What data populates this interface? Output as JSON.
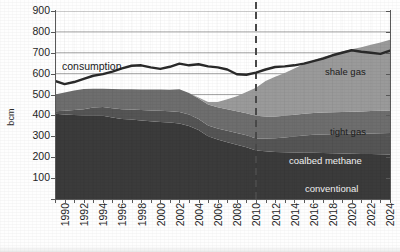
{
  "chart_data": {
    "type": "area",
    "title": "",
    "xlabel": "",
    "ylabel": "bcm",
    "ylim": [
      0,
      900
    ],
    "xlim": [
      1990,
      2025
    ],
    "grid": true,
    "legend_position": "inline-labels",
    "y_ticks": [
      100,
      200,
      300,
      400,
      500,
      600,
      700,
      800,
      900
    ],
    "x_ticks": [
      1990,
      1992,
      1994,
      1996,
      1998,
      2000,
      2002,
      2004,
      2006,
      2008,
      2010,
      2012,
      2014,
      2016,
      2018,
      2020,
      2022,
      2024
    ],
    "x": [
      1990,
      1991,
      1992,
      1993,
      1994,
      1995,
      1996,
      1997,
      1998,
      1999,
      2000,
      2001,
      2002,
      2003,
      2004,
      2005,
      2006,
      2007,
      2008,
      2009,
      2010,
      2011,
      2012,
      2013,
      2014,
      2015,
      2016,
      2017,
      2018,
      2019,
      2020,
      2021,
      2022,
      2023,
      2024,
      2025
    ],
    "stacked": true,
    "series": [
      {
        "name": "conventional",
        "color": "#3b3b3b",
        "values": [
          408,
          405,
          402,
          400,
          400,
          398,
          390,
          383,
          380,
          376,
          372,
          369,
          366,
          362,
          350,
          330,
          300,
          285,
          272,
          260,
          248,
          232,
          228,
          225,
          224,
          223,
          222,
          221,
          220,
          219,
          218,
          217,
          216,
          215,
          214,
          213
        ]
      },
      {
        "name": "coalbed methane",
        "color": "#555555",
        "values": [
          12,
          17,
          24,
          30,
          38,
          42,
          45,
          47,
          48,
          50,
          52,
          53,
          54,
          55,
          54,
          53,
          52,
          53,
          55,
          56,
          57,
          58,
          62,
          66,
          70,
          76,
          82,
          86,
          89,
          91,
          93,
          95,
          97,
          99,
          101,
          103
        ]
      },
      {
        "name": "tight gas",
        "color": "#6e6e6e",
        "values": [
          80,
          88,
          93,
          96,
          90,
          88,
          92,
          95,
          97,
          98,
          100,
          102,
          103,
          108,
          104,
          98,
          100,
          101,
          103,
          104,
          105,
          108,
          105,
          104,
          104,
          104,
          104,
          105,
          105,
          105,
          106,
          106,
          106,
          107,
          107,
          108
        ]
      },
      {
        "name": "shale gas",
        "color": "#9a9a9a",
        "values": [
          0,
          0,
          0,
          0,
          0,
          0,
          0,
          0,
          0,
          0,
          0,
          0,
          0,
          0,
          0,
          5,
          12,
          25,
          48,
          72,
          102,
          135,
          170,
          190,
          205,
          222,
          238,
          252,
          266,
          278,
          289,
          299,
          308,
          317,
          327,
          338
        ]
      }
    ],
    "line_series": {
      "name": "consumption",
      "color": "#2a2a2a",
      "values": [
        565,
        550,
        560,
        575,
        590,
        598,
        610,
        625,
        638,
        640,
        630,
        623,
        633,
        648,
        640,
        645,
        635,
        630,
        620,
        597,
        595,
        605,
        620,
        632,
        635,
        640,
        648,
        660,
        672,
        688,
        700,
        712,
        705,
        700,
        695,
        710
      ]
    },
    "annotations": [
      {
        "name": "forecast-divider",
        "type": "vertical-dashed-line",
        "x": 2011,
        "color": "#4a4a4a"
      }
    ],
    "inline_labels": [
      {
        "name": "consumption",
        "text": "consumption"
      },
      {
        "name": "shale-gas",
        "text": "shale gas"
      },
      {
        "name": "tight-gas",
        "text": "tight gas"
      },
      {
        "name": "coalbed-methane",
        "text": "coalbed methane"
      },
      {
        "name": "conventional",
        "text": "conventional"
      }
    ]
  },
  "axes": {
    "y_title": "bcm",
    "y_labels": [
      "900",
      "800",
      "700",
      "600",
      "500",
      "400",
      "300",
      "200",
      "100"
    ],
    "x_labels": [
      "1990",
      "1992",
      "1994",
      "1996",
      "1998",
      "2000",
      "2002",
      "2004",
      "2006",
      "2008",
      "2010",
      "2012",
      "2014",
      "2016",
      "2018",
      "2020",
      "2022",
      "2024"
    ]
  },
  "labels": {
    "consumption": "consumption",
    "shale_gas": "shale gas",
    "tight_gas": "tight gas",
    "coalbed_methane": "coalbed methane",
    "conventional": "conventional"
  },
  "colors": {
    "conventional": "#3b3b3b",
    "coalbed_methane": "#555555",
    "tight_gas": "#6e6e6e",
    "shale_gas": "#9a9a9a",
    "consumption_line": "#2a2a2a",
    "gridline": "#8c8c8c",
    "axis": "#5a5a5a"
  }
}
